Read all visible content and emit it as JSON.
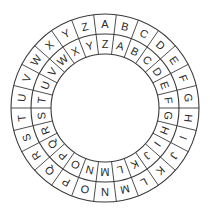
{
  "diagram": {
    "type": "cipher-wheel",
    "center": [
      105,
      108
    ],
    "radii": {
      "outer": 94,
      "middle": 74,
      "inner": 54
    },
    "line_color": "#3a3a3a",
    "text_color": "#2a2a2a",
    "outer_ring": {
      "letters": [
        "A",
        "B",
        "C",
        "D",
        "E",
        "F",
        "G",
        "H",
        "I",
        "J",
        "K",
        "L",
        "M",
        "N",
        "O",
        "P",
        "Q",
        "R",
        "S",
        "T",
        "U",
        "V",
        "W",
        "X",
        "Y",
        "Z"
      ],
      "start_angle_deg": 0
    },
    "inner_ring": {
      "letters": [
        "Z",
        "A",
        "B",
        "C",
        "D",
        "E",
        "F",
        "G",
        "H",
        "I",
        "J",
        "K",
        "L",
        "M",
        "N",
        "O",
        "P",
        "Q",
        "R",
        "S",
        "T",
        "U",
        "V",
        "W",
        "X",
        "Y"
      ],
      "start_angle_deg": 0
    }
  }
}
